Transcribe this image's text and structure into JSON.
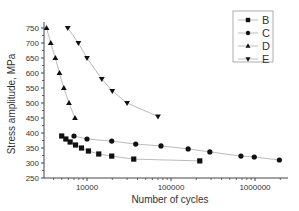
{
  "chart_data": {
    "type": "line",
    "title": "",
    "xlabel": "Number of cycles",
    "ylabel": "Stress amplitude, MPa",
    "xscale": "log",
    "xlim": [
      3100,
      2400000
    ],
    "ylim": [
      250,
      760
    ],
    "x_ticks": [
      {
        "value": 10000,
        "label": "10000"
      },
      {
        "value": 100000,
        "label": "100000"
      },
      {
        "value": 1000000,
        "label": "1000000"
      }
    ],
    "y_ticks": [
      {
        "value": 250,
        "label": "250"
      },
      {
        "value": 300,
        "label": "300"
      },
      {
        "value": 350,
        "label": "350"
      },
      {
        "value": 400,
        "label": "400"
      },
      {
        "value": 450,
        "label": "450"
      },
      {
        "value": 500,
        "label": "500"
      },
      {
        "value": 550,
        "label": "550"
      },
      {
        "value": 600,
        "label": "600"
      },
      {
        "value": 650,
        "label": "650"
      },
      {
        "value": 700,
        "label": "700"
      },
      {
        "value": 750,
        "label": "750"
      }
    ],
    "grid": false,
    "legend_position": "top-right",
    "series": [
      {
        "name": "B",
        "marker": "square",
        "x": [
          5000,
          5600,
          6300,
          7300,
          8600,
          10400,
          13800,
          19700,
          36000,
          220000
        ],
        "y": [
          390,
          380,
          370,
          360,
          350,
          340,
          330,
          323,
          313,
          307
        ]
      },
      {
        "name": "C",
        "marker": "circle",
        "x": [
          7000,
          10000,
          19700,
          38000,
          76000,
          160000,
          290000,
          680000,
          980000,
          1950000
        ],
        "y": [
          390,
          380,
          373,
          363,
          357,
          347,
          337,
          323,
          320,
          310
        ]
      },
      {
        "name": "D",
        "marker": "triangle-up",
        "x": [
          3300,
          3700,
          4200,
          4700,
          5300,
          6100,
          7200
        ],
        "y": [
          750,
          700,
          650,
          600,
          550,
          500,
          450
        ]
      },
      {
        "name": "E",
        "marker": "triangle-down",
        "x": [
          5900,
          7900,
          10000,
          15000,
          20000,
          30000,
          70000
        ],
        "y": [
          750,
          700,
          650,
          580,
          540,
          500,
          455
        ]
      }
    ]
  }
}
